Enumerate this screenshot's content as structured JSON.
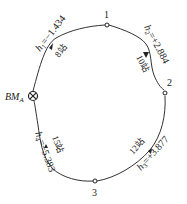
{
  "diagram": {
    "type": "closed leveling route",
    "benchmark": {
      "label": "BM",
      "subscript": "A",
      "symbol": "⊗"
    },
    "points": [
      {
        "id": "1",
        "label": "1"
      },
      {
        "id": "2",
        "label": "2"
      },
      {
        "id": "3",
        "label": "3"
      }
    ],
    "segments": [
      {
        "from": "BM_A",
        "to": "1",
        "h_var": "h",
        "h_sub": "1",
        "h_value": "=−1.434",
        "stations": "8站"
      },
      {
        "from": "1",
        "to": "2",
        "h_var": "h",
        "h_sub": "2",
        "h_value": "=+2.884",
        "stations": "10站"
      },
      {
        "from": "2",
        "to": "3",
        "h_var": "h",
        "h_sub": "3",
        "h_value": "=+3.877",
        "stations": "12站"
      },
      {
        "from": "3",
        "to": "BM_A",
        "h_var": "h",
        "h_sub": "4",
        "h_value": "=−5.383",
        "stations": "15站"
      }
    ],
    "colors": {
      "line": "#333333",
      "text": "#222222"
    }
  }
}
